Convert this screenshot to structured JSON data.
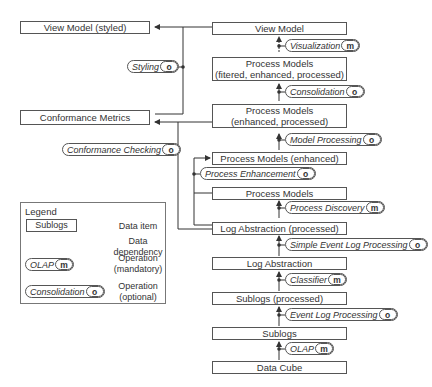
{
  "diagram": {
    "data_items": {
      "view_model_styled": "View Model (styled)",
      "conformance_metrics": "Conformance Metrics",
      "view_model": "View Model",
      "pm_filtered_line1": "Process Models",
      "pm_filtered_line2": "(fitered, enhanced, processed)",
      "pm_enh_proc_line1": "Process Models",
      "pm_enh_proc_line2": "(enhanced, processed)",
      "pm_enhanced": "Process Models (enhanced)",
      "process_models": "Process Models",
      "log_abstraction_processed": "Log Abstraction (processed)",
      "log_abstraction": "Log Abstraction",
      "sublogs_processed": "Sublogs (processed)",
      "sublogs": "Sublogs",
      "data_cube": "Data Cube"
    },
    "operations": {
      "styling": {
        "label": "Styling",
        "badge": "o"
      },
      "visualization": {
        "label": "Visualization",
        "badge": "m"
      },
      "consolidation": {
        "label": "Consolidation",
        "badge": "o"
      },
      "conformance_checking": {
        "label": "Conformance Checking",
        "badge": "o"
      },
      "model_processing": {
        "label": "Model Processing",
        "badge": "o"
      },
      "process_enhancement": {
        "label": "Process Enhancement",
        "badge": "o"
      },
      "process_discovery": {
        "label": "Process Discovery",
        "badge": "m"
      },
      "simple_event_log_processing": {
        "label": "Simple Event Log Processing",
        "badge": "o"
      },
      "classifier": {
        "label": "Classifier",
        "badge": "m"
      },
      "event_log_processing": {
        "label": "Event Log Processing",
        "badge": "o"
      },
      "olap": {
        "label": "OLAP",
        "badge": "m"
      }
    }
  },
  "legend": {
    "title": "Legend",
    "data_item_example": "Sublogs",
    "data_item_desc": "Data item",
    "dependency_desc_line1": "Data",
    "dependency_desc_line2": "dependency",
    "mandatory_example": {
      "label": "OLAP",
      "badge": "m"
    },
    "mandatory_desc_line1": "Operation",
    "mandatory_desc_line2": "(mandatory)",
    "optional_example": {
      "label": "Consolidation",
      "badge": "o"
    },
    "optional_desc_line1": "Operation",
    "optional_desc_line2": "(optional)"
  },
  "colors": {
    "line": "#333333",
    "border": "#555555",
    "text": "#333333"
  }
}
